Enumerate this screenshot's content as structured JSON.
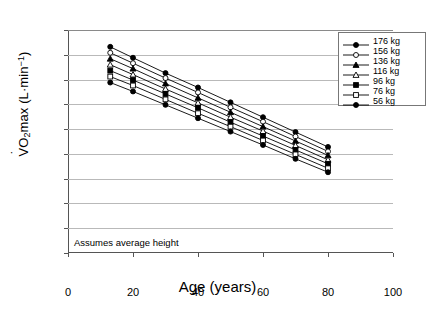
{
  "chart_data": {
    "type": "line",
    "title": "",
    "xlabel": "Age (years)",
    "ylabel": "VO2max (L·min⁻¹)",
    "ylabel_parts": {
      "v": "V",
      "o": "O",
      "two": "2",
      "max": "max",
      "units_open": " (L",
      "dot": "·",
      "unit": "min",
      "exp": "-1",
      "units_close": ")"
    },
    "annotation": "Assumes average height",
    "xlim": [
      0,
      100
    ],
    "ylim": [
      0.0,
      4.5
    ],
    "xticks": [
      0,
      20,
      40,
      60,
      80,
      100
    ],
    "yticks": [
      "0.0",
      "0.5",
      "1.0",
      "1.5",
      "2.0",
      "2.5",
      "3.0",
      "3.5",
      "4.0",
      "4.5"
    ],
    "grid": "horizontal",
    "legend_position": "top-right",
    "x": [
      13,
      20,
      30,
      40,
      50,
      60,
      70,
      80
    ],
    "series": [
      {
        "name": "176 kg",
        "marker": "filled-circle",
        "values": [
          4.16,
          3.94,
          3.63,
          3.34,
          3.04,
          2.74,
          2.44,
          2.14
        ]
      },
      {
        "name": "156 kg",
        "marker": "open-circle",
        "values": [
          4.04,
          3.83,
          3.53,
          3.24,
          2.94,
          2.65,
          2.35,
          2.05
        ]
      },
      {
        "name": "136 kg",
        "marker": "filled-triangle",
        "values": [
          3.92,
          3.72,
          3.42,
          3.13,
          2.84,
          2.55,
          2.26,
          1.97
        ]
      },
      {
        "name": "116 kg",
        "marker": "open-triangle",
        "values": [
          3.8,
          3.6,
          3.31,
          3.03,
          2.74,
          2.46,
          2.17,
          1.88
        ]
      },
      {
        "name": "96 kg",
        "marker": "filled-square",
        "values": [
          3.68,
          3.49,
          3.21,
          2.93,
          2.64,
          2.36,
          2.08,
          1.8
        ]
      },
      {
        "name": "76 kg",
        "marker": "open-square",
        "values": [
          3.56,
          3.38,
          3.1,
          2.82,
          2.55,
          2.27,
          1.99,
          1.71
        ]
      },
      {
        "name": "56 kg",
        "marker": "filled-circle",
        "values": [
          3.44,
          3.26,
          2.99,
          2.72,
          2.45,
          2.18,
          1.9,
          1.63
        ]
      }
    ]
  },
  "legend": {
    "items": [
      {
        "label": "176 kg"
      },
      {
        "label": "156 kg"
      },
      {
        "label": "136 kg"
      },
      {
        "label": "116 kg"
      },
      {
        "label": "96 kg"
      },
      {
        "label": "76 kg"
      },
      {
        "label": "56 kg"
      }
    ]
  },
  "colors": {
    "line": "#000000",
    "grid": "#b9b9b9",
    "axis": "#555555",
    "background": "#ffffff"
  }
}
